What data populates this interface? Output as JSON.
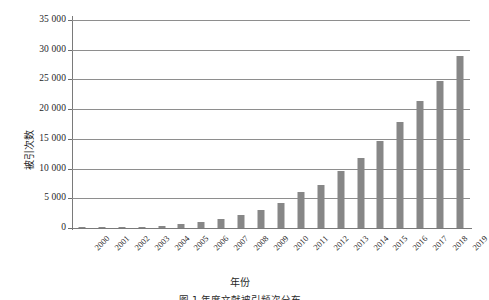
{
  "chart_data": {
    "type": "bar",
    "title": "",
    "xlabel": "年份",
    "ylabel": "被引次数",
    "categories": [
      "2000",
      "2001",
      "2002",
      "2003",
      "2004",
      "2005",
      "2006",
      "2007",
      "2008",
      "2009",
      "2010",
      "2011",
      "2012",
      "2013",
      "2014",
      "2015",
      "2016",
      "2017",
      "2018",
      "2019"
    ],
    "values": [
      30,
      60,
      130,
      250,
      400,
      650,
      1000,
      1500,
      2200,
      3000,
      4200,
      6000,
      7200,
      9600,
      11700,
      14600,
      17800,
      21400,
      24800,
      29000
    ],
    "ylim": [
      0,
      35000
    ],
    "ytick_values": [
      0,
      5000,
      10000,
      15000,
      20000,
      25000,
      30000,
      35000
    ],
    "ytick_labels": [
      "0",
      "5 000",
      "10 000",
      "15 000",
      "20 000",
      "25 000",
      "30 000",
      "35 000"
    ],
    "grid": true,
    "legend": "none",
    "series": [
      {
        "name": "被引次数",
        "values": [
          30,
          60,
          130,
          250,
          400,
          650,
          1000,
          1500,
          2200,
          3000,
          4200,
          6000,
          7200,
          9600,
          11700,
          14600,
          17800,
          21400,
          24800,
          29000
        ]
      }
    ],
    "bar_color": "#878787",
    "axis_color": "#7a7a7a",
    "grid_color": "#8e8e8e"
  },
  "caption": "图 1  年度文献被引频次分布"
}
